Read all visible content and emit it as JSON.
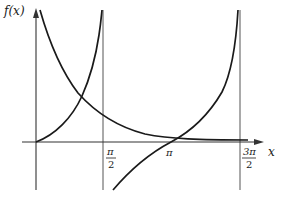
{
  "figure": {
    "y_axis_label": "f(x)",
    "x_axis_label": "x",
    "ticks": [
      {
        "id": "pi_over_2",
        "numerator": "π",
        "denominator": "2"
      },
      {
        "id": "pi",
        "label": "π"
      },
      {
        "id": "three_pi_over_2",
        "numerator": "3π",
        "denominator": "2"
      }
    ],
    "curves": [
      {
        "name": "tan-branch-1",
        "description": "increasing from origin to asymptote at π/2"
      },
      {
        "name": "tan-branch-2",
        "description": "increasing from below axis after π/2 to asymptote at 3π/2, crossing x-axis at π"
      },
      {
        "name": "decreasing-curve",
        "description": "decreasing from top near y-axis, approaching x-axis asymptotically"
      }
    ],
    "asymptotes": [
      "π/2",
      "3π/2"
    ],
    "colors": {
      "curve": "#1a1a1a",
      "axis": "#333333",
      "asymptote": "#555555"
    }
  }
}
